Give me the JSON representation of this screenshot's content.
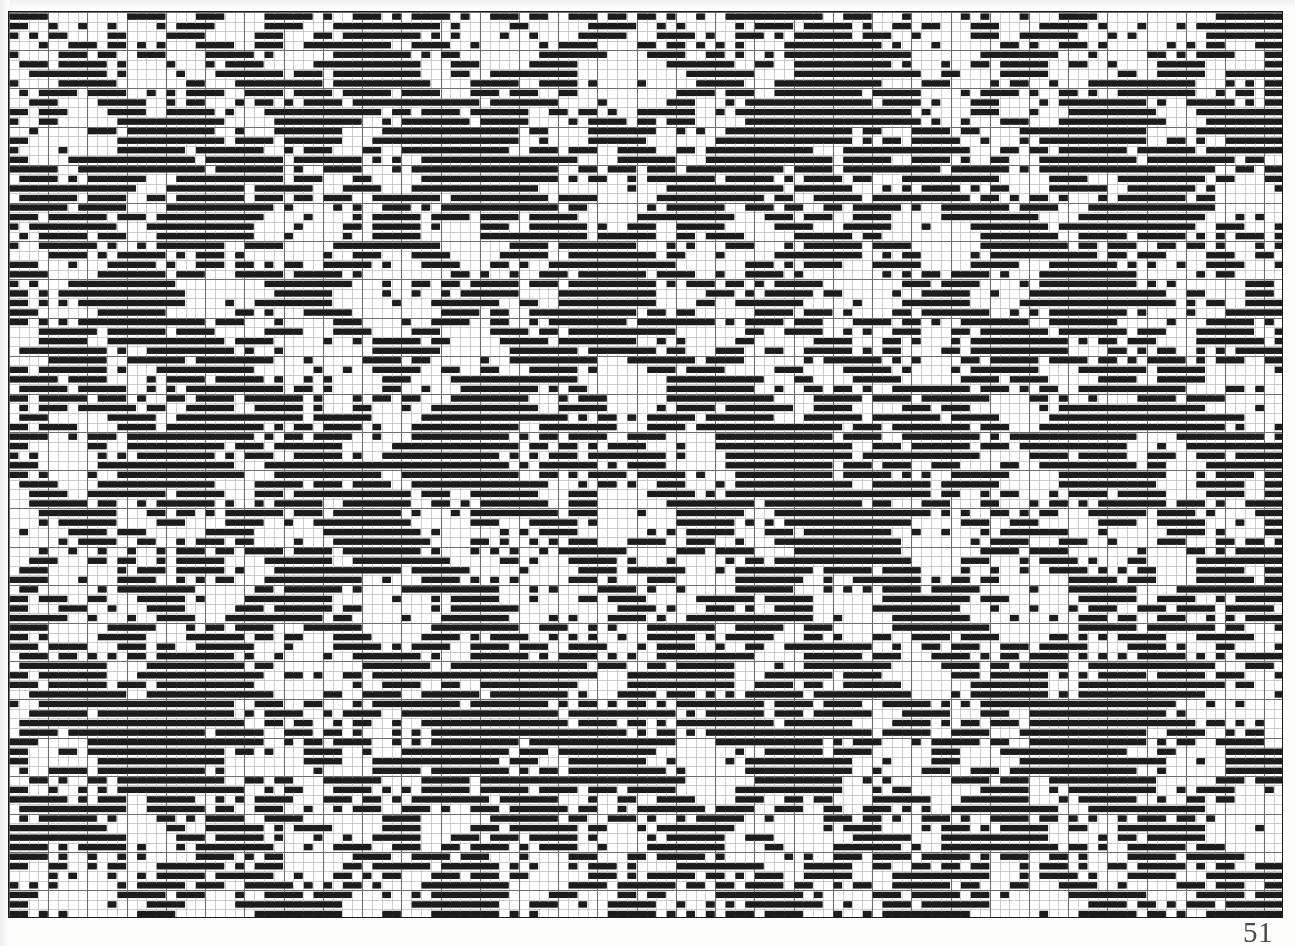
{
  "document": {
    "kind": "weaving-draft",
    "page_number": "51",
    "caption": ""
  },
  "chart_data": {
    "type": "heatmap",
    "title": "",
    "subtitle": "",
    "xlabel": "",
    "ylabel": "",
    "grid": {
      "columns": 130,
      "rows": 95,
      "cell_width_px": 9.808,
      "cell_height_px": 9.547,
      "major_gridline_every_columns": 4,
      "major_gridline_every_rows": 4
    },
    "colors": {
      "filled": "#1c1c1c",
      "empty": "#ffffff",
      "minor_gridline": "#b9b9b9",
      "major_gridline": "#6e6e6e",
      "border": "#1a1a1a",
      "page_number": "#4a4a4a"
    },
    "legend": [
      {
        "label": "warp up (filled)",
        "color": "#1c1c1c"
      },
      {
        "label": "weft up (empty)",
        "color": "#ffffff"
      }
    ],
    "pattern_model": {
      "note": "Cells are generated from a summed multi-diagonal twill rule that reproduces the interlocking diagonal / diamond motifs seen in the scan.",
      "motif_period_x": 32,
      "motif_period_y": 30,
      "diagonals": [
        {
          "slope": 1,
          "period": 16,
          "width": 4,
          "phase": 0
        },
        {
          "slope": -1,
          "period": 16,
          "width": 4,
          "phase": 5
        },
        {
          "slope": 2,
          "period": 22,
          "width": 3,
          "phase": 9
        },
        {
          "slope": -2,
          "period": 22,
          "width": 3,
          "phase": 3
        },
        {
          "slope": 1,
          "period": 48,
          "width": 6,
          "phase": 21
        },
        {
          "slope": -1,
          "period": 48,
          "width": 6,
          "phase": 11
        }
      ],
      "run_lengths_observed": [
        1,
        2,
        3,
        4,
        5,
        6
      ],
      "fill_ratio_estimate": 0.38
    },
    "axis": {
      "x_range": [
        1,
        130
      ],
      "y_range": [
        1,
        95
      ],
      "grid": true,
      "tick_labels_shown": false,
      "legend_position": "none"
    }
  }
}
